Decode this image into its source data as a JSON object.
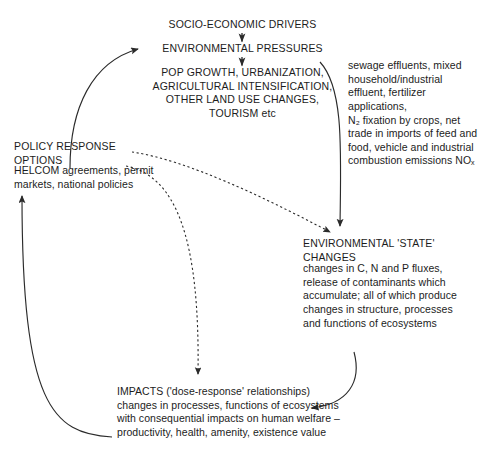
{
  "diagram": {
    "nodes": {
      "drivers": "SOCIO-ECONOMIC DRIVERS",
      "pressures": "ENVIRONMENTAL PRESSURES",
      "pop_growth": "POP GROWTH, URBANIZATION,\nAGRICULTURAL INTENSIFICATION,\nOTHER LAND USE CHANGES,\nTOURISM etc",
      "pressure_detail": "sewage effluents, mixed household/industrial effluent, fertilizer applications,\nN₂ fixation by crops, net trade in imports of feed and food, vehicle and industrial combustion emissions NOₓ",
      "policy_head": "POLICY RESPONSE\nOPTIONS",
      "policy_body": "HELCOM agreements, permit markets, national policies",
      "state_head": "ENVIRONMENTAL 'STATE'\nCHANGES",
      "state_body": "changes in C, N and P fluxes, release of contaminants which accumulate; all of which produce changes in structure, processes and functions of ecosystems",
      "impacts_body": "IMPACTS ('dose-response' relationships) changes in processes, functions of ecosystems with consequential impacts on human welfare – productivity, health, amenity, existence value"
    },
    "connectors": [
      {
        "name": "drivers-to-pressures",
        "style": "solid",
        "label": ""
      },
      {
        "name": "pressures-to-pop-growth",
        "style": "solid",
        "label": ""
      },
      {
        "name": "pressures-to-state-changes",
        "style": "solid",
        "label": ""
      },
      {
        "name": "state-changes-to-impacts",
        "style": "solid",
        "label": ""
      },
      {
        "name": "impacts-to-policy-options",
        "style": "solid",
        "label": ""
      },
      {
        "name": "policy-options-to-pressures",
        "style": "solid",
        "label": ""
      },
      {
        "name": "policy-options-to-state-changes",
        "style": "dashed",
        "label": ""
      },
      {
        "name": "policy-options-to-impacts",
        "style": "dashed",
        "label": ""
      }
    ],
    "colors": {
      "stroke": "#2b2b2b",
      "text": "#1c1c1c",
      "background": "#ffffff"
    }
  }
}
